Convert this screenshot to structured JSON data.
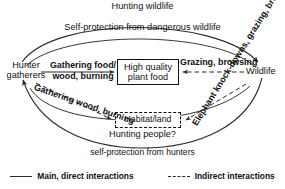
{
  "diagram": {
    "nodes": {
      "hunter_gatherers": "Hunter gatherers",
      "wildlife": "Wildlife",
      "high_quality_plant_food": "High quality plant food",
      "habitat_land": "Habitat/land"
    },
    "edge_labels": {
      "hunting_wildlife": "Hunting wildlife",
      "self_protection_from_dangerous_wildlife": "Self-protection from dangerous wildlife",
      "gathering_food_wood_burning": "Gathering food/ wood, burning",
      "grazing_browsing": "Grazing, browsing",
      "gathering_wood_burning": "Gathering wood, burning",
      "elephant_knockdowns": "Elephant knock-downs, grazing, browsing",
      "hunting_people": "Hunting people?",
      "self_protection_from_hunters": "self-protection from hunters"
    },
    "legend": {
      "main_direct": "Main, direct interactions",
      "indirect": "Indirect interactions"
    },
    "colors": {
      "line": "#2b2b2b",
      "text": "#111111",
      "background": "#ffffff"
    }
  }
}
